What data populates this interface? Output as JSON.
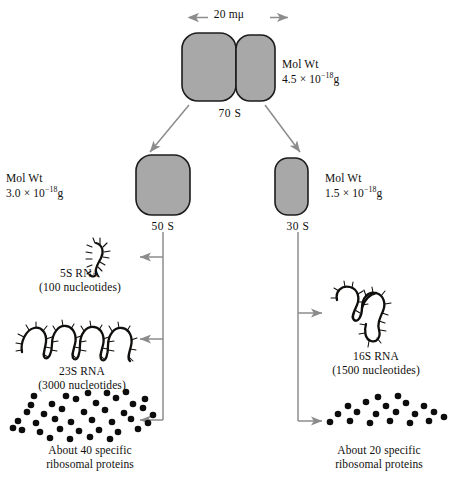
{
  "figure": {
    "scale_bar": {
      "label": "20 mμ",
      "icon": "double-headed-arrow-icon"
    }
  },
  "colors": {
    "particle_fill": "#a8a8a8",
    "particle_stroke": "#1c1c1c",
    "arrow_gray": "#8c8c8c",
    "ink": "#100f0d",
    "background": "#ffffff"
  },
  "particles": {
    "whole": {
      "name": "70S ribosome",
      "svalue": "70 S",
      "molwt_label": "Mol Wt",
      "molwt_mantissa": "4.5 × 10",
      "molwt_exponent": "−18",
      "molwt_unit": "g"
    },
    "large_subunit": {
      "name": "50S subunit",
      "svalue": "50 S",
      "molwt_label": "Mol Wt",
      "molwt_mantissa": "3.0 × 10",
      "molwt_exponent": "−18",
      "molwt_unit": "g"
    },
    "small_subunit": {
      "name": "30S subunit",
      "svalue": "30 S",
      "molwt_label": "Mol Wt",
      "molwt_mantissa": "1.5 × 10",
      "molwt_exponent": "−18",
      "molwt_unit": "g"
    }
  },
  "components": {
    "rna_5s": {
      "title": "5S RNA",
      "detail": "(100 nucleotides)",
      "icon": "rna-hairpin-icon"
    },
    "rna_23s": {
      "title": "23S RNA",
      "detail": "(3000 nucleotides)",
      "icon": "rna-long-chain-icon"
    },
    "rna_16s": {
      "title": "16S RNA",
      "detail": "(1500 nucleotides)",
      "icon": "rna-branched-icon"
    },
    "proteins_50s": {
      "line1": "About 40 specific",
      "line2": "ribosomal proteins",
      "icon": "protein-dots-icon",
      "dot_count": 40
    },
    "proteins_30s": {
      "line1": "About 20 specific",
      "line2": "ribosomal proteins",
      "icon": "protein-dots-icon",
      "dot_count": 20
    }
  }
}
